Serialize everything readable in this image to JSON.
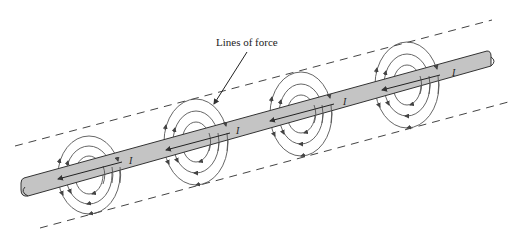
{
  "figure": {
    "annotation": "Lines of force",
    "current_symbol": "I",
    "colors": {
      "conductor_fill": "#c4c4c4",
      "line": "#333333",
      "background": "#ffffff"
    },
    "conductor": {
      "description": "Straight current-carrying conductor shown diagonally",
      "current_direction": "toward lower-left"
    },
    "field_groups": [
      {
        "id": 1,
        "cx": 89,
        "cy": 175
      },
      {
        "id": 2,
        "cx": 196,
        "cy": 142
      },
      {
        "id": 3,
        "cx": 301,
        "cy": 114
      },
      {
        "id": 4,
        "cx": 407,
        "cy": 85
      }
    ],
    "boundary_lines": [
      "upper dashed line",
      "lower dashed line"
    ]
  }
}
